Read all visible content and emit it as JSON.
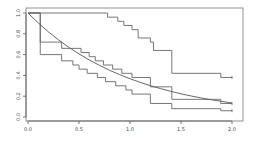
{
  "chart_data": {
    "type": "line",
    "title": "",
    "xlabel": "",
    "ylabel": "",
    "xlim": [
      0.0,
      2.0
    ],
    "ylim": [
      0.0,
      1.0
    ],
    "x_ticks": [
      "0.0",
      "0.5",
      "1.0",
      "1.5",
      "2.0"
    ],
    "y_ticks": [
      "0.0",
      "0.2",
      "0.4",
      "0.6",
      "0.8",
      "1.0"
    ],
    "grid": false,
    "legend": "none",
    "series": [
      {
        "name": "exponential-curve",
        "kind": "smooth",
        "function": "exp(-x)",
        "x": [
          0.0,
          0.1,
          0.2,
          0.3,
          0.4,
          0.5,
          0.6,
          0.7,
          0.8,
          0.9,
          1.0,
          1.1,
          1.2,
          1.3,
          1.4,
          1.5,
          1.6,
          1.7,
          1.8,
          1.9,
          2.0
        ],
        "y": [
          1.0,
          0.905,
          0.819,
          0.741,
          0.67,
          0.607,
          0.549,
          0.497,
          0.449,
          0.407,
          0.368,
          0.333,
          0.301,
          0.273,
          0.247,
          0.223,
          0.202,
          0.183,
          0.165,
          0.15,
          0.135
        ]
      },
      {
        "name": "km-upper",
        "kind": "step",
        "x": [
          0.0,
          0.78,
          0.88,
          0.94,
          1.02,
          1.08,
          1.2,
          1.23,
          1.41,
          1.89,
          2.0
        ],
        "y": [
          1.0,
          0.96,
          0.92,
          0.88,
          0.84,
          0.76,
          0.72,
          0.64,
          0.42,
          0.38,
          0.38
        ]
      },
      {
        "name": "km-middle",
        "kind": "step",
        "x": [
          0.0,
          0.12,
          0.33,
          0.52,
          0.6,
          0.66,
          0.74,
          0.83,
          0.92,
          1.02,
          1.2,
          1.41,
          1.89,
          2.0
        ],
        "y": [
          1.0,
          0.72,
          0.66,
          0.62,
          0.58,
          0.54,
          0.5,
          0.46,
          0.42,
          0.38,
          0.29,
          0.17,
          0.13,
          0.13
        ]
      },
      {
        "name": "km-lower",
        "kind": "step",
        "x": [
          0.0,
          0.12,
          0.33,
          0.44,
          0.5,
          0.58,
          0.68,
          0.76,
          0.86,
          0.96,
          1.02,
          1.2,
          1.41,
          1.89,
          2.0
        ],
        "y": [
          1.0,
          0.6,
          0.54,
          0.5,
          0.46,
          0.42,
          0.38,
          0.34,
          0.3,
          0.26,
          0.22,
          0.13,
          0.08,
          0.06,
          0.06
        ]
      }
    ]
  }
}
